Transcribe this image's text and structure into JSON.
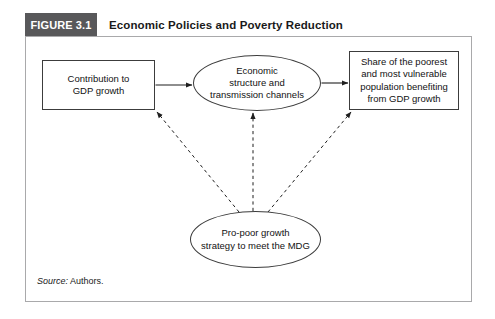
{
  "figure": {
    "badge": "FIGURE 3.1",
    "title": "Economic Policies and Poverty Reduction",
    "source_label": "Source:",
    "source_value": " Authors."
  },
  "nodes": {
    "contribution": {
      "line1": "Contribution to",
      "line2": "GDP growth"
    },
    "structure": {
      "line1": "Economic",
      "line2": "structure and",
      "line3": "transmission channels"
    },
    "share": {
      "line1": "Share of the poorest",
      "line2": "and most vulnerable",
      "line3": "population benefiting",
      "line4": "from GDP growth"
    },
    "propoor": {
      "line1": "Pro-poor growth",
      "line2": "strategy to meet the MDG"
    }
  },
  "connectors": [
    {
      "name": "contribution-to-structure",
      "style": "solid",
      "from": "contribution",
      "to": "structure",
      "arrow": "end"
    },
    {
      "name": "structure-to-share",
      "style": "solid",
      "from": "structure",
      "to": "share",
      "arrow": "end"
    },
    {
      "name": "propoor-to-contribution",
      "style": "dashed",
      "from": "propoor",
      "to": "contribution",
      "arrow": "end"
    },
    {
      "name": "propoor-to-structure",
      "style": "dashed",
      "from": "propoor",
      "to": "structure",
      "arrow": "end"
    },
    {
      "name": "propoor-to-share",
      "style": "dashed",
      "from": "propoor",
      "to": "share",
      "arrow": "end"
    }
  ],
  "colors": {
    "badge_background": "#58585a",
    "badge_text": "#ffffff",
    "frame_border": "#a9a9ab",
    "node_border": "#3c3c3c",
    "connector": "#1f1f1f",
    "page_background": "#ffffff"
  }
}
